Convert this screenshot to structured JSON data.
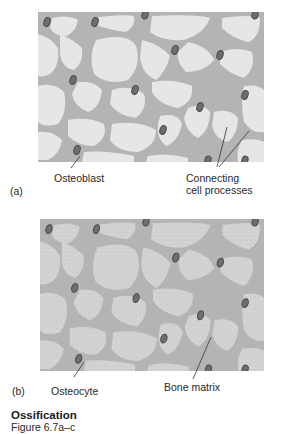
{
  "figure": {
    "title": "Ossification",
    "subtitle": "Figure 6.7a–c"
  },
  "panels": [
    {
      "id": "a",
      "tag": "(a)",
      "style": "smooth",
      "labels": [
        {
          "text": "Osteoblast"
        },
        {
          "text_line1": "Connecting",
          "text_line2": "cell processes"
        }
      ]
    },
    {
      "id": "b",
      "tag": "(b)",
      "style": "stippled",
      "labels": [
        {
          "text": "Osteocyte"
        },
        {
          "text": "Bone matrix"
        }
      ]
    }
  ],
  "colors": {
    "channel": "#b4b4b4",
    "lacuna_smooth": "#e6e6e6",
    "lacuna_stippled": "#d2d2d2",
    "nucleus": "#6e6e6e",
    "nucleus_ring": "#4a4a4a"
  }
}
